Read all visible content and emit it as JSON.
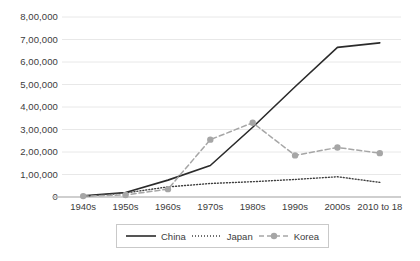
{
  "chart_data": {
    "type": "line",
    "title": "",
    "subtitle": "",
    "xlabel": "",
    "ylabel": "",
    "categories": [
      "1940s",
      "1950s",
      "1960s",
      "1970s",
      "1980s",
      "1990s",
      "2000s",
      "2010 to 18"
    ],
    "ytick_labels": [
      "0",
      "1,00,000",
      "2,00,000",
      "3,00,000",
      "4,00,000",
      "5,00,000",
      "6,00,000",
      "7,00,000",
      "8,00,000"
    ],
    "ytick_values": [
      0,
      100000,
      200000,
      300000,
      400000,
      500000,
      600000,
      700000,
      800000
    ],
    "ylim": [
      0,
      800000
    ],
    "grid": true,
    "legend_position": "bottom",
    "series": [
      {
        "name": "China",
        "style": "solid",
        "color": "#2b2b2b",
        "markers": false,
        "values": [
          5000,
          20000,
          75000,
          140000,
          310000,
          490000,
          665000,
          685000
        ]
      },
      {
        "name": "Japan",
        "style": "dotted",
        "color": "#3f3f3f",
        "markers": false,
        "values": [
          3000,
          18000,
          45000,
          60000,
          68000,
          78000,
          90000,
          65000
        ]
      },
      {
        "name": "Korea",
        "style": "dashed",
        "color": "#a6a6a6",
        "markers": true,
        "values": [
          4000,
          9000,
          35000,
          255000,
          330000,
          185000,
          220000,
          195000
        ]
      }
    ]
  },
  "legend": {
    "items": [
      {
        "label": "China"
      },
      {
        "label": "Japan"
      },
      {
        "label": "Korea"
      }
    ]
  },
  "colors": {
    "china": "#2b2b2b",
    "japan": "#3f3f3f",
    "korea": "#a6a6a6",
    "grid": "#e8e8e8",
    "axis": "#bfbfbf",
    "text": "#3c3c3c",
    "legend_border": "#c9c9c9"
  }
}
